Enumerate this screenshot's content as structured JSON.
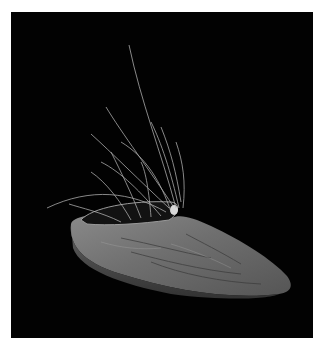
{
  "image": {
    "subject": "sculpture of a grey shoe-like form with thin wire or grass strands rising from its opening",
    "background_color": "#020202",
    "border_color": "#ffffff"
  }
}
